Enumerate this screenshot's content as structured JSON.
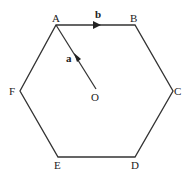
{
  "diagram": {
    "vertices": [
      {
        "label": "A",
        "x": 56,
        "y": 25
      },
      {
        "label": "B",
        "x": 135,
        "y": 25
      },
      {
        "label": "C",
        "x": 173,
        "y": 91
      },
      {
        "label": "D",
        "x": 135,
        "y": 157
      },
      {
        "label": "E",
        "x": 58,
        "y": 157
      },
      {
        "label": "F",
        "x": 20,
        "y": 91
      }
    ],
    "centre": {
      "label": "O",
      "x": 96,
      "y": 89
    },
    "vectors": [
      {
        "label": "a",
        "from": "O",
        "to": "A"
      },
      {
        "label": "b",
        "from": "A",
        "to": "B"
      }
    ],
    "colors": {
      "line": "#333333",
      "background": "#ffffff"
    }
  }
}
